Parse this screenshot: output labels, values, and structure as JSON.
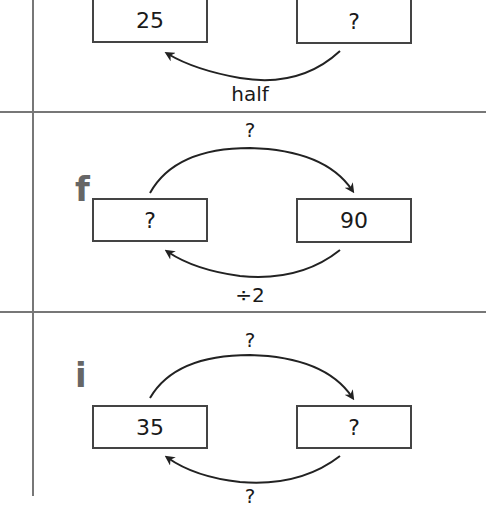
{
  "problems": [
    {
      "letter": "",
      "left_box": "25",
      "right_box": "?",
      "top_operation": "",
      "bottom_operation": "half"
    },
    {
      "letter": "f",
      "left_box": "?",
      "right_box": "90",
      "top_operation": "?",
      "bottom_operation": "÷2"
    },
    {
      "letter": "i",
      "left_box": "35",
      "right_box": "?",
      "top_operation": "?",
      "bottom_operation": "?"
    }
  ],
  "colors": {
    "line": "#777777",
    "box_border": "#444444",
    "letter": "#666666"
  }
}
